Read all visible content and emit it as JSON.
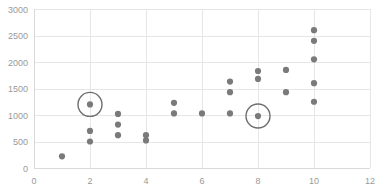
{
  "chart_data": {
    "type": "scatter",
    "title": "",
    "subtitle": "",
    "xlabel": "",
    "ylabel": "",
    "xlim": [
      0,
      12
    ],
    "ylim": [
      0,
      3000
    ],
    "x_ticks": [
      0,
      2,
      4,
      6,
      8,
      10,
      12
    ],
    "x_tick_labels": [
      "0",
      "2",
      "4",
      "6",
      "8",
      "10",
      "12"
    ],
    "y_ticks": [
      0,
      500,
      1000,
      1500,
      2000,
      2500,
      3000
    ],
    "y_tick_labels": [
      "0",
      "500",
      "1000",
      "1500",
      "2000",
      "2500",
      "3000"
    ],
    "grid": true,
    "legend": null,
    "series": [
      {
        "name": "points",
        "marker": "circle",
        "color": "#7a7a7a",
        "points": [
          {
            "x": 1,
            "y": 220
          },
          {
            "x": 2,
            "y": 500
          },
          {
            "x": 2,
            "y": 700
          },
          {
            "x": 2,
            "y": 1200
          },
          {
            "x": 3,
            "y": 620
          },
          {
            "x": 3,
            "y": 820
          },
          {
            "x": 3,
            "y": 1020
          },
          {
            "x": 4,
            "y": 520
          },
          {
            "x": 4,
            "y": 620
          },
          {
            "x": 5,
            "y": 1030
          },
          {
            "x": 5,
            "y": 1230
          },
          {
            "x": 6,
            "y": 1030
          },
          {
            "x": 7,
            "y": 1030
          },
          {
            "x": 7,
            "y": 1430
          },
          {
            "x": 7,
            "y": 1630
          },
          {
            "x": 8,
            "y": 980
          },
          {
            "x": 8,
            "y": 1680
          },
          {
            "x": 8,
            "y": 1830
          },
          {
            "x": 9,
            "y": 1430
          },
          {
            "x": 9,
            "y": 1850
          },
          {
            "x": 10,
            "y": 1250
          },
          {
            "x": 10,
            "y": 1600
          },
          {
            "x": 10,
            "y": 2050
          },
          {
            "x": 10,
            "y": 2400
          },
          {
            "x": 10,
            "y": 2600
          }
        ]
      }
    ],
    "annotations": [
      {
        "kind": "circle-highlight",
        "x": 2,
        "y": 1200,
        "radius_px": 12
      },
      {
        "kind": "circle-highlight",
        "x": 8,
        "y": 980,
        "radius_px": 12
      }
    ],
    "colors": {
      "marker": "#7a7a7a",
      "grid": "#e6e6e6",
      "axis": "#d9d9d9",
      "tick_text": "#999999",
      "highlight_ring": "#6e6e6e",
      "background": "#ffffff"
    }
  }
}
